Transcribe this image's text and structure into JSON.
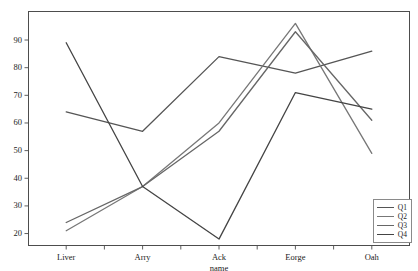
{
  "chart_data": {
    "type": "line",
    "title": "",
    "xlabel": "name",
    "ylabel": "",
    "categories": [
      "Liver",
      "Arry",
      "Ack",
      "Eorge",
      "Oah"
    ],
    "series": [
      {
        "name": "Q1",
        "values": [
          64,
          57,
          84,
          78,
          86
        ],
        "color": "#555555"
      },
      {
        "name": "Q2",
        "values": [
          21,
          37,
          60,
          96,
          49
        ],
        "color": "#777777"
      },
      {
        "name": "Q3",
        "values": [
          24,
          37,
          57,
          93,
          61
        ],
        "color": "#666666"
      },
      {
        "name": "Q4",
        "values": [
          89,
          37,
          18,
          71,
          65
        ],
        "color": "#444444"
      }
    ],
    "yticks": [
      20,
      30,
      40,
      50,
      60,
      70,
      80,
      90
    ],
    "ylim": [
      15.5,
      100.5
    ],
    "grid": true,
    "legend_position": "bottom-right",
    "legend_entries": [
      "Q1",
      "Q2",
      "Q3",
      "Q4"
    ]
  },
  "colors": {
    "grid": "#b9b9b9",
    "frame": "#4d4d4d",
    "text": "#1c1c1c",
    "background": "#ffffff"
  }
}
